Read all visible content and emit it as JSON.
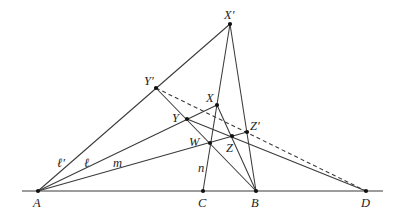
{
  "diagram": {
    "type": "projective-geometry-construction",
    "points": [
      {
        "id": "A",
        "label": "A"
      },
      {
        "id": "C",
        "label": "C"
      },
      {
        "id": "B",
        "label": "B"
      },
      {
        "id": "D",
        "label": "D"
      },
      {
        "id": "Xp",
        "label": "X′"
      },
      {
        "id": "Yp",
        "label": "Y′"
      },
      {
        "id": "X",
        "label": "X"
      },
      {
        "id": "Y",
        "label": "Y"
      },
      {
        "id": "Zp",
        "label": "Z′"
      },
      {
        "id": "Z",
        "label": "Z"
      },
      {
        "id": "W",
        "label": "W"
      }
    ],
    "line_labels": {
      "l_prime": "ℓ′",
      "l": "ℓ",
      "m": "m",
      "n": "n"
    },
    "segments": [
      {
        "from": "A",
        "to": "D",
        "style": "solid",
        "name": "base-line"
      },
      {
        "from": "A",
        "to": "Xp",
        "style": "solid",
        "name": "line-l-prime"
      },
      {
        "from": "A",
        "to": "X",
        "style": "solid",
        "name": "line-l"
      },
      {
        "from": "A",
        "to": "Zp",
        "style": "solid",
        "name": "line-m"
      },
      {
        "from": "C",
        "to": "Xp",
        "style": "solid",
        "name": "line-n"
      },
      {
        "from": "B",
        "to": "Xp",
        "style": "solid",
        "name": "line-b-xprime"
      },
      {
        "from": "Yp",
        "to": "B",
        "style": "solid",
        "name": "line-yprime-b"
      },
      {
        "from": "X",
        "to": "B",
        "style": "solid",
        "name": "line-x-b"
      },
      {
        "from": "Y",
        "to": "D",
        "style": "solid",
        "name": "line-y-d"
      },
      {
        "from": "Yp",
        "to": "D",
        "style": "dashed",
        "name": "line-yprime-d"
      }
    ]
  }
}
